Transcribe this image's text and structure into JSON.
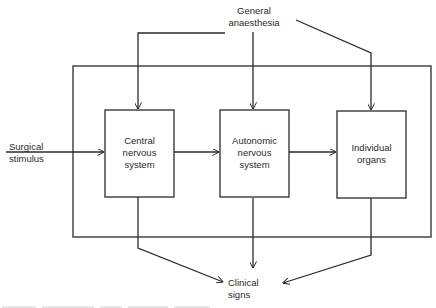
{
  "diagram": {
    "type": "block-flow-diagram",
    "inputs": {
      "top": "General\nanaesthesia",
      "left": "Surgical\nstimulus"
    },
    "blocks": [
      {
        "id": "cns",
        "label": "Central\nnervous\nsystem"
      },
      {
        "id": "ans",
        "label": "Autonomic\nnervous\nsystem"
      },
      {
        "id": "organs",
        "label": "Individual\norgans"
      }
    ],
    "output": "Clinical\nsigns",
    "edges": [
      {
        "from": "General anaesthesia",
        "to": "Central nervous system"
      },
      {
        "from": "General anaesthesia",
        "to": "Autonomic nervous system"
      },
      {
        "from": "General anaesthesia",
        "to": "Individual organs"
      },
      {
        "from": "Surgical stimulus",
        "to": "Central nervous system"
      },
      {
        "from": "Central nervous system",
        "to": "Autonomic nervous system"
      },
      {
        "from": "Autonomic nervous system",
        "to": "Individual organs"
      },
      {
        "from": "Central nervous system",
        "to": "Clinical signs"
      },
      {
        "from": "Autonomic nervous system",
        "to": "Clinical signs"
      },
      {
        "from": "Individual organs",
        "to": "Clinical signs"
      }
    ],
    "caption_note": "caption partially visible, illegible"
  },
  "colors": {
    "line": "#2b2b2b",
    "background": "#ffffff",
    "text": "#2a2a2a"
  }
}
